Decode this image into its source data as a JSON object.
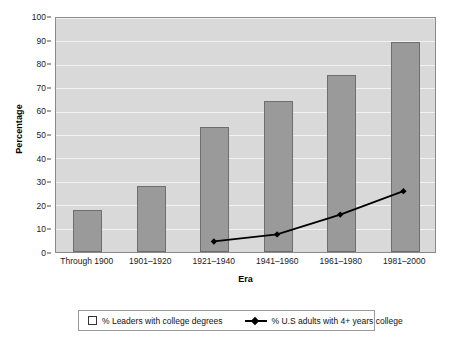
{
  "chart_data": {
    "type": "bar",
    "title": "",
    "xlabel": "Era",
    "ylabel": "Percentage",
    "categories": [
      "Through 1900",
      "1901–1920",
      "1921–1940",
      "1941–1960",
      "1961–1980",
      "1981–2000"
    ],
    "ylim": [
      0,
      100
    ],
    "yticks": [
      0,
      10,
      20,
      30,
      40,
      50,
      60,
      70,
      80,
      90,
      100
    ],
    "ytick_labels": [
      "0",
      "10",
      "20",
      "30",
      "40",
      "50",
      "60",
      "70",
      "80",
      "90",
      "100"
    ],
    "grid": true,
    "legend_position": "bottom",
    "series": [
      {
        "name": "% Leaders with college degrees",
        "type": "bar",
        "values": [
          18,
          28,
          53,
          64,
          75,
          89
        ],
        "color": "#9a9a9a",
        "edge_color": "#6e6e6e"
      },
      {
        "name": "% U.S adults with 4+ years college",
        "type": "line",
        "values": [
          null,
          null,
          4.5,
          7.5,
          16,
          26
        ],
        "color": "#000000",
        "marker": "diamond"
      }
    ]
  },
  "axes": {
    "y_title": "Percentage",
    "x_title": "Era",
    "y_tick_labels": [
      "100",
      "90",
      "80",
      "70",
      "60",
      "50",
      "40",
      "30",
      "20",
      "10",
      "0"
    ],
    "x_tick_labels": [
      "Through 1900",
      "1901–1920",
      "1921–1940",
      "1941–1960",
      "1961–1980",
      "1981–2000"
    ]
  },
  "legend": {
    "entry_bar_label": "% Leaders with college degrees",
    "entry_line_label": "% U.S adults with 4+ years college"
  },
  "colors": {
    "plot_background": "#d9d9d9",
    "gridline": "#f2f2f2",
    "bar_fill": "#9a9a9a",
    "bar_edge": "#6e6e6e",
    "line": "#000000",
    "page_background": "#ffffff"
  }
}
